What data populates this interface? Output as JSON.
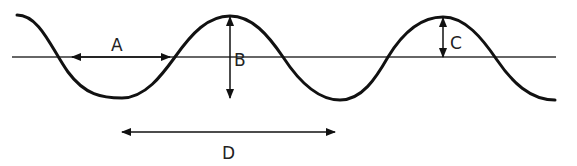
{
  "diagram": {
    "type": "transverse-wave",
    "colors": {
      "wave": "#111111",
      "axis": "#333333",
      "arrow": "#111111",
      "label": "#222222",
      "background": "#ffffff"
    },
    "axis": {
      "y": 57,
      "x1": 12,
      "x2": 556
    },
    "wave_path": "M17,15 C40,15 52,50 68,72 C85,95 102,98 122,98 C145,98 162,75 175,57 C192,33 208,16 230,16 C252,16 268,35 283,57 C298,80 318,100 340,100 C362,100 376,78 388,57 C402,34 420,17 443,17 C465,17 482,38 497,60 C512,82 530,100 555,100",
    "labels": {
      "A": "A",
      "B": "B",
      "C": "C",
      "D": "D"
    },
    "annotations": [
      {
        "id": "A",
        "kind": "horizontal-double-arrow",
        "x1": 72,
        "x2": 170,
        "y": 57,
        "label_x": 118,
        "label_y": 50,
        "meaning": "distance between adjacent axis crossings (half wavelength)"
      },
      {
        "id": "B",
        "kind": "vertical-double-arrow",
        "x": 230,
        "y1": 16,
        "y2": 98,
        "label_x": 234,
        "label_y": 65,
        "meaning": "crest to trough height"
      },
      {
        "id": "C",
        "kind": "vertical-double-arrow",
        "x": 443,
        "y1": 17,
        "y2": 57,
        "label_x": 450,
        "label_y": 48,
        "meaning": "amplitude"
      },
      {
        "id": "D",
        "kind": "horizontal-double-arrow",
        "x1": 122,
        "x2": 335,
        "y": 132,
        "label_x": 228,
        "label_y": 158,
        "meaning": "wavelength (trough to trough)"
      }
    ]
  }
}
